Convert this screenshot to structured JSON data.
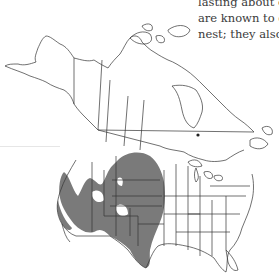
{
  "caption": {
    "lines": [
      "lasting about o",
      "are known to d",
      "nest; they also c"
    ]
  },
  "map": {
    "title": "Range map of North America",
    "region": "North America",
    "range_fill_color": "#7a7a7a",
    "outline_color": "#333333",
    "background": "#ffffff",
    "range_description": "Shaded range covering the Great Plains and American Southwest, from the Dakotas south through Texas and west through Nevada, Arizona and southern California",
    "shaded_states": [
      "North Dakota",
      "South Dakota",
      "Nebraska",
      "Kansas",
      "Oklahoma",
      "Texas",
      "New Mexico",
      "Arizona",
      "Nevada",
      "Utah",
      "Colorado",
      "Wyoming",
      "Montana",
      "Idaho",
      "Oregon",
      "California"
    ]
  }
}
